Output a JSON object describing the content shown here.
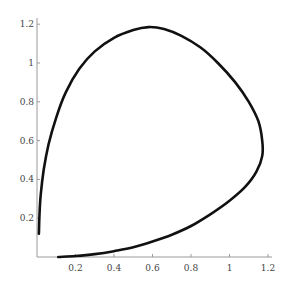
{
  "chart_data": {
    "type": "line",
    "title": "",
    "xlabel": "",
    "ylabel": "",
    "xlim": [
      0,
      1.25
    ],
    "ylim": [
      0,
      1.22
    ],
    "grid": false,
    "legend": null,
    "x_ticks": [
      {
        "value": 0.2,
        "label": "0.2"
      },
      {
        "value": 0.4,
        "label": "0.4"
      },
      {
        "value": 0.6,
        "label": "0.6"
      },
      {
        "value": 0.8,
        "label": "0.8"
      },
      {
        "value": 1.0,
        "label": "1"
      },
      {
        "value": 1.2,
        "label": "1.2"
      }
    ],
    "y_ticks": [
      {
        "value": 0.2,
        "label": "0.2"
      },
      {
        "value": 0.4,
        "label": "0.4"
      },
      {
        "value": 0.6,
        "label": "0.6"
      },
      {
        "value": 0.8,
        "label": "0.8"
      },
      {
        "value": 1.0,
        "label": "1"
      },
      {
        "value": 1.2,
        "label": "1.2"
      }
    ],
    "series": [
      {
        "name": "parametric curve",
        "color": "#111111",
        "points": [
          [
            0.11,
            0.0
          ],
          [
            0.2,
            0.005
          ],
          [
            0.3,
            0.015
          ],
          [
            0.4,
            0.03
          ],
          [
            0.5,
            0.05
          ],
          [
            0.6,
            0.08
          ],
          [
            0.7,
            0.115
          ],
          [
            0.8,
            0.16
          ],
          [
            0.9,
            0.22
          ],
          [
            1.0,
            0.29
          ],
          [
            1.08,
            0.36
          ],
          [
            1.14,
            0.44
          ],
          [
            1.17,
            0.52
          ],
          [
            1.17,
            0.6
          ],
          [
            1.15,
            0.7
          ],
          [
            1.1,
            0.8
          ],
          [
            1.03,
            0.9
          ],
          [
            0.94,
            1.0
          ],
          [
            0.85,
            1.08
          ],
          [
            0.75,
            1.14
          ],
          [
            0.66,
            1.175
          ],
          [
            0.58,
            1.185
          ],
          [
            0.5,
            1.17
          ],
          [
            0.4,
            1.13
          ],
          [
            0.3,
            1.06
          ],
          [
            0.22,
            0.97
          ],
          [
            0.15,
            0.85
          ],
          [
            0.1,
            0.72
          ],
          [
            0.06,
            0.58
          ],
          [
            0.035,
            0.45
          ],
          [
            0.02,
            0.33
          ],
          [
            0.013,
            0.22
          ],
          [
            0.01,
            0.12
          ]
        ]
      }
    ]
  }
}
